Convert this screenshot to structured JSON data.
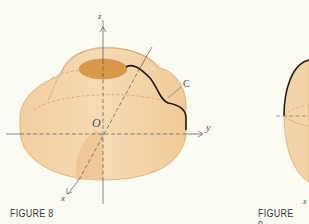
{
  "figures": [
    {
      "id": "figure-8",
      "caption": "FIGURE 8",
      "labels": {
        "z_axis": "z",
        "y_axis": "y",
        "x_axis": "x",
        "origin": "O",
        "curve": "C"
      },
      "description": "Surface of revolution around the z-axis with a dark curve C lying on its surface",
      "colors": {
        "surface": "#f3d3a8",
        "surface_shadow": "#e8bb85",
        "top_hole": "#d9994a",
        "curve": "#1a1a1a",
        "axes": "#555555",
        "outline": "#c9945a"
      }
    },
    {
      "id": "figure-9",
      "caption": "FIGURE 9",
      "labels": {
        "x_axis": "x"
      },
      "description": "Partially visible sphere with dark meridian curve (cut off at right edge)",
      "colors": {
        "surface": "#f3d3a8",
        "curve": "#1a1a1a"
      }
    }
  ],
  "background": "#fdfcf3"
}
